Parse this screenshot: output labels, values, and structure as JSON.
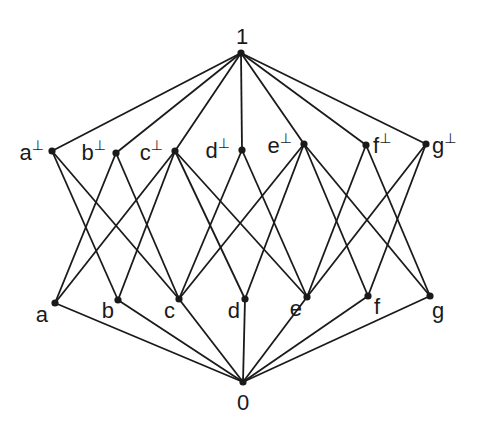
{
  "diagram": {
    "type": "hasse-diagram",
    "nodes": [
      {
        "id": "1",
        "label": "1",
        "sup": "",
        "x": 241,
        "y": 53,
        "lx": 236,
        "ly": 44,
        "anchor": "start"
      },
      {
        "id": "a_perp",
        "label": "a",
        "sup": "⊥",
        "x": 52,
        "y": 151,
        "lx": 44,
        "ly": 160,
        "anchor": "end"
      },
      {
        "id": "b_perp",
        "label": "b",
        "sup": "⊥",
        "x": 116,
        "y": 153,
        "lx": 106,
        "ly": 160,
        "anchor": "end"
      },
      {
        "id": "c_perp",
        "label": "c",
        "sup": "⊥",
        "x": 175,
        "y": 151,
        "lx": 163,
        "ly": 160,
        "anchor": "end"
      },
      {
        "id": "d_perp",
        "label": "d",
        "sup": "⊥",
        "x": 242,
        "y": 150,
        "lx": 230,
        "ly": 158,
        "anchor": "end"
      },
      {
        "id": "e_perp",
        "label": "e",
        "sup": "⊥",
        "x": 304,
        "y": 144,
        "lx": 292,
        "ly": 153,
        "anchor": "end"
      },
      {
        "id": "f_perp",
        "label": "f",
        "sup": "⊥",
        "x": 366,
        "y": 145,
        "lx": 373,
        "ly": 153,
        "anchor": "start"
      },
      {
        "id": "g_perp",
        "label": "g",
        "sup": "⊥",
        "x": 426,
        "y": 144,
        "lx": 432,
        "ly": 153,
        "anchor": "start"
      },
      {
        "id": "a",
        "label": "a",
        "sup": "",
        "x": 55,
        "y": 303,
        "lx": 48,
        "ly": 322,
        "anchor": "end"
      },
      {
        "id": "b",
        "label": "b",
        "sup": "",
        "x": 118,
        "y": 300,
        "lx": 114,
        "ly": 318,
        "anchor": "end"
      },
      {
        "id": "c",
        "label": "c",
        "sup": "",
        "x": 179,
        "y": 299,
        "lx": 175,
        "ly": 318,
        "anchor": "end"
      },
      {
        "id": "d",
        "label": "d",
        "sup": "",
        "x": 245,
        "y": 299,
        "lx": 240,
        "ly": 318,
        "anchor": "end"
      },
      {
        "id": "e",
        "label": "e",
        "sup": "",
        "x": 307,
        "y": 297,
        "lx": 302,
        "ly": 316,
        "anchor": "end"
      },
      {
        "id": "f",
        "label": "f",
        "sup": "",
        "x": 368,
        "y": 296,
        "lx": 374,
        "ly": 314,
        "anchor": "start"
      },
      {
        "id": "g",
        "label": "g",
        "sup": "",
        "x": 430,
        "y": 296,
        "lx": 432,
        "ly": 318,
        "anchor": "start"
      },
      {
        "id": "0",
        "label": "0",
        "sup": "",
        "x": 243,
        "y": 382,
        "lx": 237,
        "ly": 410,
        "anchor": "start"
      }
    ],
    "edges": [
      [
        "1",
        "a_perp"
      ],
      [
        "1",
        "b_perp"
      ],
      [
        "1",
        "c_perp"
      ],
      [
        "1",
        "d_perp"
      ],
      [
        "1",
        "e_perp"
      ],
      [
        "1",
        "f_perp"
      ],
      [
        "1",
        "g_perp"
      ],
      [
        "a_perp",
        "b"
      ],
      [
        "a_perp",
        "c"
      ],
      [
        "b_perp",
        "a"
      ],
      [
        "b_perp",
        "c"
      ],
      [
        "c_perp",
        "a"
      ],
      [
        "c_perp",
        "b"
      ],
      [
        "c_perp",
        "d"
      ],
      [
        "c_perp",
        "e"
      ],
      [
        "d_perp",
        "c"
      ],
      [
        "d_perp",
        "e"
      ],
      [
        "e_perp",
        "c"
      ],
      [
        "e_perp",
        "d"
      ],
      [
        "e_perp",
        "f"
      ],
      [
        "e_perp",
        "g"
      ],
      [
        "f_perp",
        "e"
      ],
      [
        "f_perp",
        "g"
      ],
      [
        "g_perp",
        "e"
      ],
      [
        "g_perp",
        "f"
      ],
      [
        "a",
        "0"
      ],
      [
        "b",
        "0"
      ],
      [
        "c",
        "0"
      ],
      [
        "d",
        "0"
      ],
      [
        "e",
        "0"
      ],
      [
        "f",
        "0"
      ],
      [
        "g",
        "0"
      ]
    ]
  }
}
